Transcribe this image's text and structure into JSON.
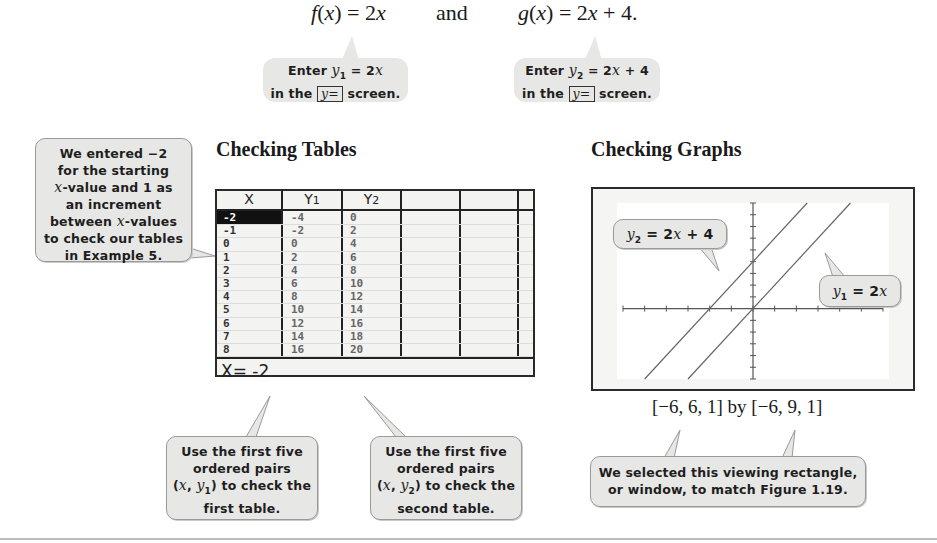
{
  "equations": {
    "f": "f(x) = 2x",
    "and": "and",
    "g": "g(x) = 2x + 4."
  },
  "callouts": {
    "enter_y1": {
      "line1_prefix": "Enter ",
      "var": "y",
      "sub": "1",
      "line1_suffix": " = 2x",
      "line2_prefix": "in the ",
      "key": "y=",
      "line2_suffix": " screen."
    },
    "enter_y2": {
      "line1_prefix": "Enter ",
      "var": "y",
      "sub": "2",
      "line1_suffix": " = 2x + 4",
      "line2_prefix": "in the ",
      "key": "y=",
      "line2_suffix": " screen."
    },
    "table_setup": [
      "We entered −2",
      "for the starting",
      "x-value and 1 as",
      "an increment",
      "between x-values",
      "to check our tables",
      "in Example 5."
    ],
    "first_table": [
      "Use the first five",
      "ordered pairs",
      "(x, y₁) to check the",
      "first table."
    ],
    "second_table": [
      "Use the first five",
      "ordered pairs",
      "(x, y₂) to check the",
      "second table."
    ],
    "window_note": [
      "We selected this viewing rectangle,",
      "or window, to match Figure 1.19."
    ]
  },
  "headings": {
    "tables": "Checking Tables",
    "graphs": "Checking Graphs"
  },
  "calculator_table": {
    "headers": [
      "X",
      "Y1",
      "Y2",
      "",
      "",
      ""
    ],
    "x": [
      "-2",
      "-1",
      "0",
      "1",
      "2",
      "3",
      "4",
      "5",
      "6",
      "7",
      "8"
    ],
    "y1": [
      "-4",
      "-2",
      "0",
      "2",
      "4",
      "6",
      "8",
      "10",
      "12",
      "14",
      "16"
    ],
    "y2": [
      "0",
      "2",
      "4",
      "6",
      "8",
      "10",
      "12",
      "14",
      "16",
      "18",
      "20"
    ],
    "selected_row": 0,
    "status": "X= -2"
  },
  "chart_data": {
    "type": "line",
    "title": "Checking Graphs",
    "xlim": [
      -6,
      6
    ],
    "ylim": [
      -6,
      9
    ],
    "xscl": 1,
    "yscl": 1,
    "grid": false,
    "series": [
      {
        "name": "y1 = 2x",
        "label": "y₁ = 2x",
        "slope": 2,
        "intercept": 0,
        "x": [
          -3,
          4.5
        ],
        "y": [
          -6,
          9
        ]
      },
      {
        "name": "y2 = 2x + 4",
        "label": "y₂ = 2x + 4",
        "slope": 2,
        "intercept": 4,
        "x": [
          -5,
          2.5
        ],
        "y": [
          -6,
          9
        ]
      }
    ],
    "window_label": "[−6, 6, 1] by [−6, 9, 1]"
  }
}
